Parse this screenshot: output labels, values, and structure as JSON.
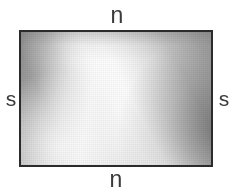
{
  "figure": {
    "name": "bar-magnet-pole-diagram",
    "background_color": "#ffffff",
    "width": 236,
    "height": 187
  },
  "magnet": {
    "shape": "rectangle",
    "border_color": "#2b2b2b",
    "border_width_px": 2,
    "x": 19,
    "y": 30,
    "width": 194,
    "height": 137,
    "fill_description": "grayscale gradient with bright diagonal highlight band",
    "sampled_colors": {
      "top_left": "#9a9a9a",
      "top_center": "#f7f7f7",
      "top_right": "#c8c8c8",
      "center_left": "#f6f6f6",
      "center": "#e4e4e4",
      "center_right": "#c0c0c0",
      "bottom_left": "#f2f2f2",
      "bottom_center": "#dedede",
      "bottom_right": "#949494",
      "highlight": "#fbfbfb"
    }
  },
  "labels": {
    "top": "n",
    "bottom": "n",
    "left": "s",
    "right": "s",
    "color": "#3a3a3a"
  }
}
